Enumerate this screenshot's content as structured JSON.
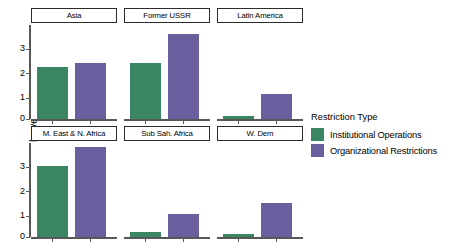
{
  "chart_data": {
    "type": "bar",
    "title": "",
    "xlabel": "",
    "ylabel": "Average Level of Restrictions",
    "ylim": [
      0,
      3.6
    ],
    "yticks": [
      0,
      1,
      2,
      3
    ],
    "ytick_labels": [
      "0",
      "1",
      "2",
      "3"
    ],
    "grid": false,
    "facet_layout": {
      "rows": 2,
      "cols": 3
    },
    "legend": {
      "title": "Restriction Type",
      "position": "right",
      "entries": [
        {
          "name": "Institutional Operations",
          "color": "#3a8562"
        },
        {
          "name": "Organizational Restrictions",
          "color": "#6b5e9e"
        }
      ]
    },
    "categories": [
      "Institutional Operations",
      "Organizational Restrictions"
    ],
    "series": [
      {
        "name": "Institutional Operations",
        "color": "#3a8562"
      },
      {
        "name": "Organizational Restrictions",
        "color": "#6b5e9e"
      }
    ],
    "facets": [
      {
        "label": "Asia",
        "row": 0,
        "col": 0,
        "values": [
          2.0,
          2.15
        ]
      },
      {
        "label": "Former USSR",
        "row": 0,
        "col": 1,
        "values": [
          2.15,
          3.27
        ]
      },
      {
        "label": "Latin America",
        "row": 0,
        "col": 2,
        "values": [
          0.12,
          0.95
        ]
      },
      {
        "label": "M. East & N. Africa",
        "row": 1,
        "col": 0,
        "values": [
          2.72,
          3.46
        ]
      },
      {
        "label": "Sub Sah. Africa",
        "row": 1,
        "col": 1,
        "values": [
          0.2,
          0.88
        ]
      },
      {
        "label": "W. Dem",
        "row": 1,
        "col": 2,
        "values": [
          0.1,
          1.3
        ]
      }
    ]
  },
  "colors": {
    "institutional_operations": "#3a8562",
    "organizational_restrictions": "#6b5e9e",
    "axis": "#585858",
    "strip_border": "#2b2b2b",
    "background": "#ffffff"
  }
}
